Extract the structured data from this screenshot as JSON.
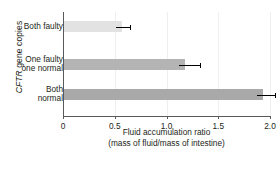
{
  "chart_data": {
    "type": "bar",
    "orientation": "horizontal",
    "title": "",
    "xlabel": "Fluid accumulation ratio",
    "xlabel_sub": "(mass of fluid/mass of intestine)",
    "ylabel_italic": "CFTR",
    "ylabel_rest": " gene copies",
    "ylabel": "CFTR gene copies",
    "categories": [
      "Both faulty",
      "One faulty\none normal",
      "Both\nnormal"
    ],
    "values": [
      0.57,
      1.18,
      1.93
    ],
    "errors_high": [
      0.65,
      1.32,
      2.05
    ],
    "bar_colors": [
      "#e2e2e2",
      "#b4b4b4",
      "#a9a9a9"
    ],
    "xlim": [
      0,
      2.0
    ],
    "xticks": [
      0,
      0.5,
      1.0,
      1.5,
      2.0
    ],
    "xticklabels": [
      "0",
      "0.5",
      "1.0",
      "1.5",
      "2.0"
    ],
    "grid": true,
    "grid_axis": "x",
    "legend": null,
    "axis_color": "#58595b",
    "grid_color": "#efefef"
  }
}
